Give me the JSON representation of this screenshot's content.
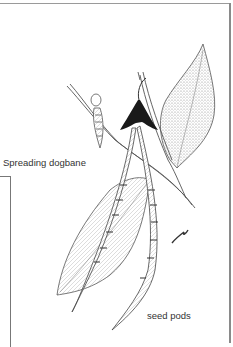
{
  "illustration": {
    "subject": "Spreading dogbane",
    "labels": {
      "plant_name": "Spreading dogbane",
      "part": "seed pods"
    },
    "icons": [
      "leaf-drawing",
      "seed-pod-drawing",
      "flower-calyx-drawing",
      "artist-signature"
    ]
  }
}
